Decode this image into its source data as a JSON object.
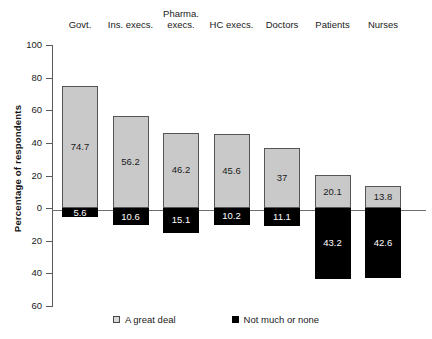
{
  "chart_data": {
    "type": "bar",
    "title": "",
    "subtitle": "",
    "xlabel": "",
    "ylabel": "Percentage of respondents",
    "ylim": [
      -60,
      100
    ],
    "yticks": [
      100,
      80,
      60,
      40,
      20,
      0,
      20,
      40,
      60
    ],
    "ytick_labels": [
      "100",
      "80",
      "60",
      "40",
      "20",
      "0",
      "20",
      "40",
      "60"
    ],
    "grid": false,
    "legend_position": "bottom",
    "stacked": "diverging",
    "categories": [
      "Govt.",
      "Ins. execs.",
      "Pharma.\nexecs.",
      "HC execs.",
      "Doctors",
      "Patients",
      "Nurses"
    ],
    "series": [
      {
        "name": "A great deal",
        "color": "#c9c9c9",
        "direction": "up",
        "values": [
          74.7,
          56.2,
          46.2,
          45.6,
          37,
          20.1,
          13.8
        ],
        "labels": [
          "74.7",
          "56.2",
          "46.2",
          "45.6",
          "37",
          "20.1",
          "13.8"
        ]
      },
      {
        "name": "Not much or none",
        "color": "#000000",
        "direction": "down",
        "values": [
          5.6,
          10.6,
          15.1,
          10.2,
          11.1,
          43.2,
          42.6
        ],
        "labels": [
          "5.6",
          "10.6",
          "15.1",
          "10.2",
          "11.1",
          "43.2",
          "42.6"
        ]
      }
    ]
  },
  "legend": {
    "items": [
      {
        "label": "A great deal",
        "swatch": "light-gray-square"
      },
      {
        "label": "Not much or none",
        "swatch": "black-square"
      }
    ]
  },
  "axis": {
    "y_title": "Percentage of respondents"
  }
}
